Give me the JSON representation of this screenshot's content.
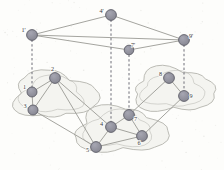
{
  "figure": {
    "type": "network-topology-diagram",
    "title": "",
    "background_color": "#fdfdfb",
    "palette": {
      "node_fill": "#8f8f9c",
      "node_stroke": "#5d5d68",
      "edge_color": "#9a9a94",
      "dashed_color": "#6f6f78",
      "cloud_stroke": "#b4b4ae",
      "cloud_fill": "#f4f4f0",
      "label_color": "#3a3a3a"
    }
  },
  "abstract_layer": {
    "name": "upper abstract graph",
    "nodes": [
      {
        "id": "1p",
        "label": "1'",
        "x": 32,
        "y": 35,
        "r": 5.4,
        "label_dx": -8.5,
        "label_dy": -3.5
      },
      {
        "id": "4p",
        "label": "4'",
        "x": 111,
        "y": 15,
        "r": 5.4,
        "label_dx": -9.5,
        "label_dy": -2.0
      },
      {
        "id": "7p",
        "label": "7'",
        "x": 129,
        "y": 50,
        "r": 4.8,
        "label_dx": 4.0,
        "label_dy": -3.5
      },
      {
        "id": "9p",
        "label": "9'",
        "x": 184,
        "y": 40,
        "r": 5.4,
        "label_dx": 7.0,
        "label_dy": -2.5
      }
    ],
    "edges": [
      {
        "from": "1p",
        "to": "4p"
      },
      {
        "from": "4p",
        "to": "9p"
      },
      {
        "from": "1p",
        "to": "9p"
      },
      {
        "from": "1p",
        "to": "7p"
      },
      {
        "from": "7p",
        "to": "9p"
      }
    ]
  },
  "domains": [
    {
      "id": "cloud-left",
      "name": "left network domain",
      "cx": 52,
      "cy": 95,
      "rx": 44,
      "ry": 26
    },
    {
      "id": "cloud-right",
      "name": "right network domain",
      "cx": 173,
      "cy": 90,
      "rx": 44,
      "ry": 25
    },
    {
      "id": "cloud-bottom",
      "name": "bottom network domain",
      "cx": 118,
      "cy": 130,
      "rx": 48,
      "ry": 26
    }
  ],
  "physical_layer": {
    "name": "lower physical graph",
    "nodes": [
      {
        "id": "n1",
        "label": "1",
        "x": 32,
        "y": 92,
        "r": 5.0,
        "label_dx": -7.5,
        "label_dy": -3.0,
        "domain": "cloud-left"
      },
      {
        "id": "n2",
        "label": "2",
        "x": 55,
        "y": 78,
        "r": 5.4,
        "label_dx": -2.5,
        "label_dy": -7.5,
        "domain": "cloud-left"
      },
      {
        "id": "n3",
        "label": "3",
        "x": 33,
        "y": 110,
        "r": 5.0,
        "label_dx": -8.0,
        "label_dy": -2.5,
        "domain": "cloud-left"
      },
      {
        "id": "n4",
        "label": "4",
        "x": 111,
        "y": 127,
        "r": 5.4,
        "label_dx": -9.5,
        "label_dy": -1.5,
        "domain": "cloud-bottom"
      },
      {
        "id": "n5",
        "label": "5",
        "x": 96,
        "y": 147,
        "r": 5.4,
        "label_dx": -8.5,
        "label_dy": 4.5,
        "domain": "cloud-bottom"
      },
      {
        "id": "n6",
        "label": "6",
        "x": 142,
        "y": 136,
        "r": 5.4,
        "label_dx": -3.0,
        "label_dy": 9.0,
        "domain": "cloud-bottom"
      },
      {
        "id": "n7",
        "label": "7",
        "x": 129,
        "y": 115,
        "r": 5.4,
        "label_dx": 6.5,
        "label_dy": 5.5,
        "domain": "cloud-bottom"
      },
      {
        "id": "n8",
        "label": "8",
        "x": 169,
        "y": 78,
        "r": 5.4,
        "label_dx": -8.5,
        "label_dy": -2.0,
        "domain": "cloud-right"
      },
      {
        "id": "n9",
        "label": "9",
        "x": 184,
        "y": 96,
        "r": 5.4,
        "label_dx": 7.0,
        "label_dy": 1.5,
        "domain": "cloud-right"
      }
    ],
    "edges": [
      {
        "from": "n1",
        "to": "n2"
      },
      {
        "from": "n1",
        "to": "n3"
      },
      {
        "from": "n2",
        "to": "n3"
      },
      {
        "from": "n2",
        "to": "n4"
      },
      {
        "from": "n2",
        "to": "n5"
      },
      {
        "from": "n3",
        "to": "n5"
      },
      {
        "from": "n4",
        "to": "n5"
      },
      {
        "from": "n4",
        "to": "n7"
      },
      {
        "from": "n4",
        "to": "n6"
      },
      {
        "from": "n5",
        "to": "n6"
      },
      {
        "from": "n6",
        "to": "n7"
      },
      {
        "from": "n6",
        "to": "n9"
      },
      {
        "from": "n7",
        "to": "n8"
      },
      {
        "from": "n8",
        "to": "n9"
      }
    ]
  },
  "projections": [
    {
      "id": "proj-1",
      "from": "1p",
      "to": "n1",
      "style": "dashed"
    },
    {
      "id": "proj-4",
      "from": "4p",
      "to": "n4",
      "style": "dashed"
    },
    {
      "id": "proj-7",
      "from": "7p",
      "to": "n7",
      "style": "dashed"
    },
    {
      "id": "proj-9",
      "from": "9p",
      "to": "n9",
      "style": "dashed"
    }
  ]
}
